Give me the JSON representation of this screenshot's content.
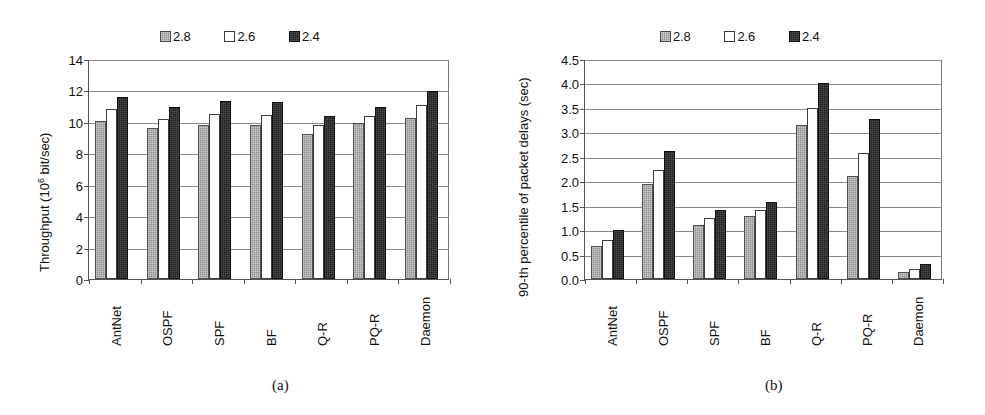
{
  "figure": {
    "panels": [
      {
        "id": "a",
        "caption": "(a)",
        "legend": [
          {
            "label": "2.8",
            "swatch": "filled-gray-square-icon",
            "color": "#8e8e8e"
          },
          {
            "label": "2.6",
            "swatch": "empty-white-square-icon",
            "color": "#ffffff"
          },
          {
            "label": "2.4",
            "swatch": "filled-black-square-icon",
            "color": "#1c1c1c"
          }
        ],
        "chart_data": {
          "type": "bar",
          "title": "",
          "xlabel": "",
          "ylabel": "Throughput (10⁶ bit/sec)",
          "ylim": [
            0,
            14
          ],
          "ytick_step": 2,
          "ytick_labels": [
            "0",
            "2",
            "4",
            "6",
            "8",
            "10",
            "12",
            "14"
          ],
          "grid": true,
          "legend_position": "top-center",
          "categories": [
            "AntNet",
            "OSPF",
            "SPF",
            "BF",
            "Q-R",
            "PQ-R",
            "Daemon"
          ],
          "series": [
            {
              "name": "2.8",
              "values": [
                10.05,
                9.6,
                9.8,
                9.8,
                9.25,
                9.95,
                10.25
              ]
            },
            {
              "name": "2.6",
              "values": [
                10.8,
                10.2,
                10.5,
                10.45,
                9.8,
                10.4,
                11.05
              ]
            },
            {
              "name": "2.4",
              "values": [
                11.6,
                10.95,
                11.3,
                11.25,
                10.4,
                10.95,
                11.95
              ]
            }
          ]
        }
      },
      {
        "id": "b",
        "caption": "(b)",
        "legend": [
          {
            "label": "2.8",
            "swatch": "filled-gray-square-icon",
            "color": "#8e8e8e"
          },
          {
            "label": "2.6",
            "swatch": "empty-white-square-icon",
            "color": "#ffffff"
          },
          {
            "label": "2.4",
            "swatch": "filled-black-square-icon",
            "color": "#1c1c1c"
          }
        ],
        "chart_data": {
          "type": "bar",
          "title": "",
          "xlabel": "",
          "ylabel": "90-th percentile of packet delays (sec)",
          "ylim": [
            0,
            4.5
          ],
          "ytick_step": 0.5,
          "ytick_labels": [
            "0.0",
            "0.5",
            "1.0",
            "1.5",
            "2.0",
            "2.5",
            "3.0",
            "3.5",
            "4.0",
            "4.5"
          ],
          "grid": true,
          "legend_position": "top-center",
          "categories": [
            "AntNet",
            "OSPF",
            "SPF",
            "BF",
            "Q-R",
            "PQ-R",
            "Daemon"
          ],
          "series": [
            {
              "name": "2.8",
              "values": [
                0.67,
                1.95,
                1.11,
                1.28,
                3.15,
                2.1,
                0.14
              ]
            },
            {
              "name": "2.6",
              "values": [
                0.8,
                2.24,
                1.24,
                1.42,
                3.49,
                2.57,
                0.21
              ]
            },
            {
              "name": "2.4",
              "values": [
                1.0,
                2.62,
                1.42,
                1.58,
                4.0,
                3.28,
                0.31
              ]
            }
          ]
        }
      }
    ]
  }
}
